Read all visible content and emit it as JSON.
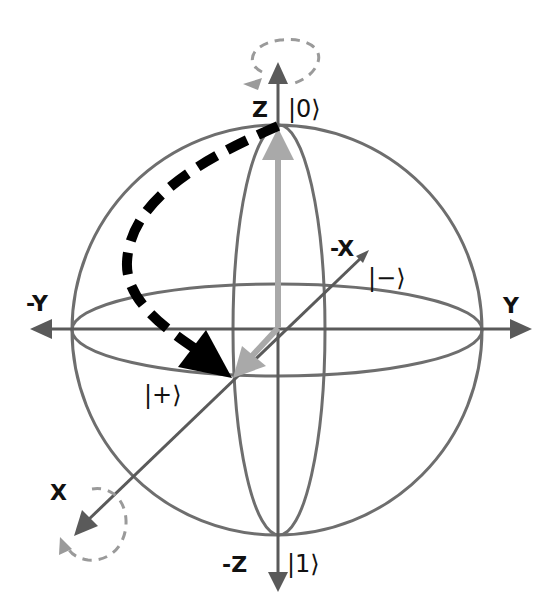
{
  "diagram": {
    "colors": {
      "sphere": "#6e6e6e",
      "axis": "#5a5a5a",
      "path": "#000000",
      "state_vector": "#a9a9a9",
      "rotation_hint": "#9a9a9a",
      "text": "#111111"
    },
    "axes": {
      "z_pos": "Z",
      "z_neg": "-Z",
      "y_pos": "Y",
      "y_neg": "-Y",
      "x_pos": "X",
      "x_neg": "-X"
    },
    "states": {
      "zero": "|0⟩",
      "one": "|1⟩",
      "plus": "|+⟩",
      "minus": "|−⟩"
    },
    "transition": {
      "from": "|0⟩",
      "to": "|+⟩",
      "style": "dashed-curved-arrow"
    }
  }
}
